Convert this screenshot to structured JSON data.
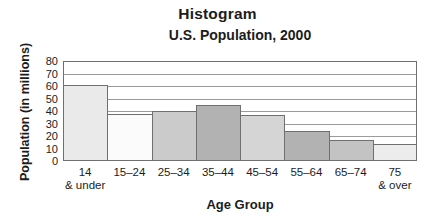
{
  "figure": {
    "title": "Histogram",
    "subtitle": "U.S. Population, 2000"
  },
  "chart_data": {
    "type": "bar",
    "title": "Histogram",
    "subtitle": "U.S. Population, 2000",
    "xlabel": "Age Group",
    "ylabel": "Population (in millions)",
    "categories": [
      "14 & under",
      "15–24",
      "25–34",
      "35–44",
      "45–54",
      "55–64",
      "65–74",
      "75 & over"
    ],
    "category_label_lines": [
      [
        "14",
        "& under"
      ],
      [
        "15–24"
      ],
      [
        "25–34"
      ],
      [
        "35–44"
      ],
      [
        "45–54"
      ],
      [
        "55–64"
      ],
      [
        "65–74"
      ],
      [
        "75",
        "& over"
      ]
    ],
    "values": [
      61,
      38,
      40,
      45,
      37,
      24,
      17,
      14
    ],
    "ylim": [
      0,
      80
    ],
    "yticks": [
      80,
      70,
      60,
      50,
      40,
      30,
      20,
      10,
      0
    ],
    "grid": true,
    "legend": "none",
    "bar_colors": [
      "#eaeaea",
      "#fbfbfb",
      "#cbcbcb",
      "#b2b2b2",
      "#d5d5d5",
      "#b2b2b2",
      "#c3c3c3",
      "#ececec"
    ],
    "bar_border_color": "#6f6f6f",
    "grid_color": "#9b9b9b",
    "axis_color": "#6f6f6f",
    "text_color": "#1c1c1c"
  }
}
